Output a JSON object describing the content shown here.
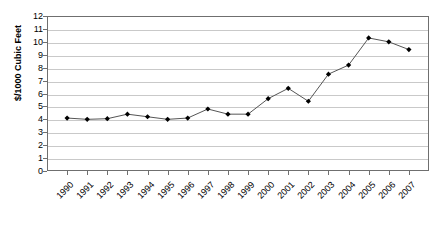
{
  "chart_data": {
    "type": "line",
    "title": "",
    "xlabel": "",
    "ylabel": "$/1000 Cubic Feet",
    "ylim": [
      0,
      12
    ],
    "ytick_step": 1,
    "grid": true,
    "legend": "none",
    "marker": "diamond",
    "marker_color": "#000000",
    "line_color": "#555555",
    "categories": [
      "1990",
      "1991",
      "1992",
      "1993",
      "1994",
      "1995",
      "1996",
      "1997",
      "1998",
      "1999",
      "2000",
      "2001",
      "2002",
      "2003",
      "2004",
      "2005",
      "2006",
      "2007"
    ],
    "values": [
      4.1,
      4.0,
      4.05,
      4.4,
      4.2,
      4.0,
      4.1,
      4.8,
      4.4,
      4.4,
      5.6,
      6.4,
      5.4,
      7.5,
      8.2,
      10.3,
      10.0,
      9.4
    ],
    "ytick_labels": [
      "12",
      "11",
      "10",
      "9",
      "8",
      "7",
      "6",
      "5",
      "4",
      "3",
      "2",
      "1",
      "0"
    ]
  }
}
